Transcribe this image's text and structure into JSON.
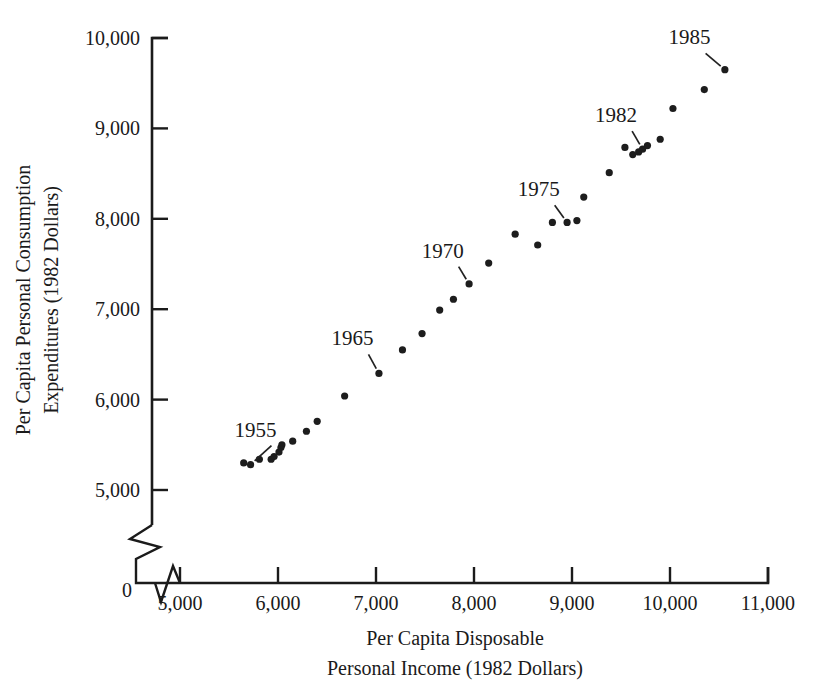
{
  "chart_data": {
    "type": "scatter",
    "title": "",
    "xlabel": "Per Capita Disposable Personal Income (1982 Dollars)",
    "ylabel": "Per Capita Personal Consumption Expenditures (1982 Dollars)",
    "xlabel_line1": "Per Capita Disposable",
    "xlabel_line2": "Personal Income (1982 Dollars)",
    "ylabel_line1": "Per Capita Personal Consumption",
    "ylabel_line2": "Expenditures (1982 Dollars)",
    "xlim": [
      4500,
      11000
    ],
    "ylim": [
      4750,
      10000
    ],
    "grid": false,
    "legend": null,
    "axis_break_x": true,
    "axis_break_y": true,
    "origin_label": "0",
    "xticks": [
      5000,
      6000,
      7000,
      8000,
      9000,
      10000,
      11000
    ],
    "xtick_labels": [
      "5,000",
      "6,000",
      "7,000",
      "8,000",
      "9,000",
      "10,000",
      "11,000"
    ],
    "yticks": [
      5000,
      6000,
      7000,
      8000,
      9000,
      10000
    ],
    "ytick_labels": [
      "5,000",
      "6,000",
      "7,000",
      "8,000",
      "9,000",
      "10,000"
    ],
    "points": [
      {
        "year": 1953,
        "x": 5650,
        "y": 5300
      },
      {
        "year": 1954,
        "x": 5720,
        "y": 5280
      },
      {
        "year": 1955,
        "x": 5810,
        "y": 5340
      },
      {
        "year": 1956,
        "x": 5930,
        "y": 5340
      },
      {
        "year": 1957,
        "x": 5960,
        "y": 5370
      },
      {
        "year": 1958,
        "x": 6010,
        "y": 5420
      },
      {
        "year": 1959,
        "x": 6030,
        "y": 5470
      },
      {
        "year": 1960,
        "x": 6040,
        "y": 5500
      },
      {
        "year": 1961,
        "x": 6150,
        "y": 5540
      },
      {
        "year": 1962,
        "x": 6290,
        "y": 5650
      },
      {
        "year": 1963,
        "x": 6400,
        "y": 5760
      },
      {
        "year": 1964,
        "x": 6680,
        "y": 6040
      },
      {
        "year": 1965,
        "x": 7030,
        "y": 6290
      },
      {
        "year": 1966,
        "x": 7270,
        "y": 6550
      },
      {
        "year": 1967,
        "x": 7470,
        "y": 6730
      },
      {
        "year": 1968,
        "x": 7650,
        "y": 6990
      },
      {
        "year": 1969,
        "x": 7790,
        "y": 7110
      },
      {
        "year": 1970,
        "x": 7950,
        "y": 7280
      },
      {
        "year": 1971,
        "x": 8150,
        "y": 7510
      },
      {
        "year": 1972,
        "x": 8420,
        "y": 7830
      },
      {
        "year": 1973,
        "x": 8800,
        "y": 7960
      },
      {
        "year": 1974,
        "x": 8650,
        "y": 7710
      },
      {
        "year": 1975,
        "x": 8950,
        "y": 7960
      },
      {
        "year": 1976,
        "x": 9050,
        "y": 7980
      },
      {
        "year": 1977,
        "x": 9120,
        "y": 8240
      },
      {
        "year": 1978,
        "x": 9380,
        "y": 8510
      },
      {
        "year": 1979,
        "x": 9540,
        "y": 8790
      },
      {
        "year": 1980,
        "x": 9620,
        "y": 8710
      },
      {
        "year": 1981,
        "x": 9680,
        "y": 8740
      },
      {
        "year": 1982,
        "x": 9720,
        "y": 8770
      },
      {
        "year": 1983,
        "x": 9770,
        "y": 8810
      },
      {
        "year": 1984,
        "x": 9900,
        "y": 8880
      },
      {
        "year": 1985,
        "x": 10030,
        "y": 9220
      },
      {
        "year": 1986,
        "x": 10350,
        "y": 9430
      },
      {
        "year": 1987,
        "x": 10560,
        "y": 9650
      }
    ],
    "annotations": [
      {
        "label": "1955",
        "label_x": 5770,
        "label_y": 5590,
        "point_x": 5720,
        "point_y": 5280
      },
      {
        "label": "1965",
        "label_x": 6760,
        "label_y": 6600,
        "point_x": 7030,
        "point_y": 6290
      },
      {
        "label": "1970",
        "label_x": 7680,
        "label_y": 7570,
        "point_x": 7950,
        "point_y": 7280
      },
      {
        "label": "1975",
        "label_x": 8660,
        "label_y": 8250,
        "point_x": 8950,
        "point_y": 7960
      },
      {
        "label": "1982",
        "label_x": 9450,
        "label_y": 9070,
        "point_x": 9720,
        "point_y": 8770
      },
      {
        "label": "1985",
        "label_x": 10200,
        "label_y": 9930,
        "point_x": 10560,
        "point_y": 9650
      }
    ]
  },
  "style": {
    "marker_color": "#1d1d1d",
    "axis_color": "#1b1b1b",
    "background": "#ffffff",
    "marker_radius": 3.6
  }
}
